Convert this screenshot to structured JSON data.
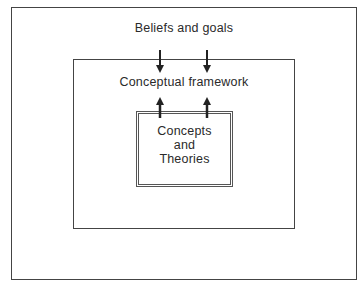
{
  "diagram": {
    "type": "nested-boxes",
    "outer": {
      "label": "Beliefs and goals"
    },
    "middle": {
      "label": "Conceptual framework"
    },
    "inner": {
      "label_lines": [
        "Concepts",
        "and",
        "Theories"
      ]
    },
    "arrows": [
      {
        "from": "Beliefs and goals",
        "to": "Conceptual framework",
        "direction": "down",
        "count": 2
      },
      {
        "from": "Concepts and Theories",
        "to": "Conceptual framework",
        "direction": "up",
        "count": 2
      }
    ]
  }
}
